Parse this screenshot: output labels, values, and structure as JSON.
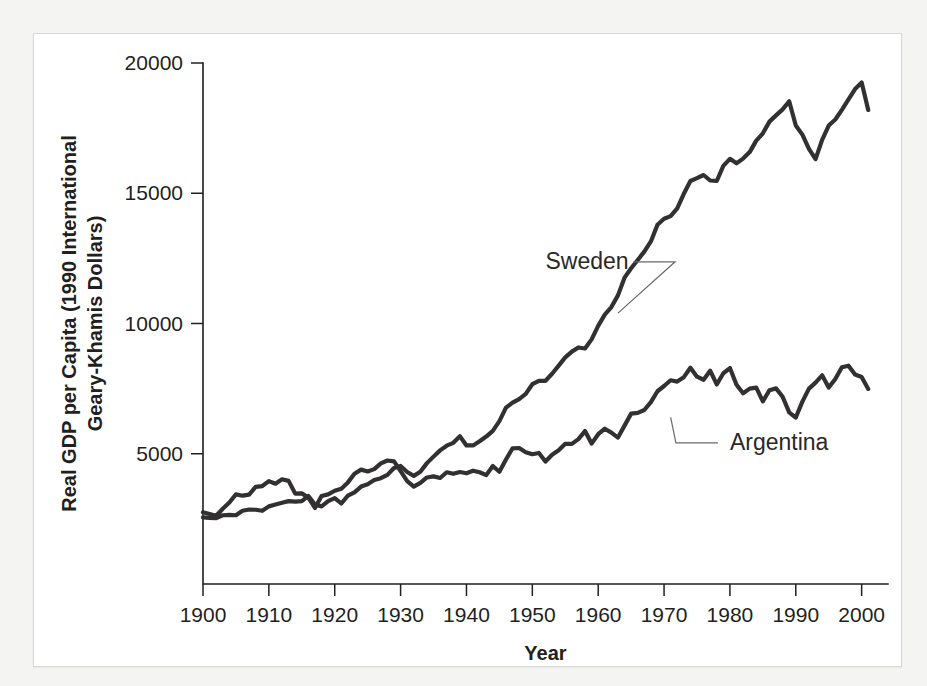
{
  "figure": {
    "background_color": "#f4f4f3",
    "card_color": "#ffffff",
    "line_color": "#333031",
    "text_color": "#231f20"
  },
  "chart_data": {
    "type": "line",
    "title": "",
    "xlabel": "Year",
    "ylabel": "Real GDP per Capita (1990 International Geary-Khamis Dollars)",
    "ylabel_line1": "Real GDP per Capita (1990 International",
    "ylabel_line2": "Geary-Khamis Dollars)",
    "xlim": [
      1900,
      2004
    ],
    "ylim": [
      0,
      20000
    ],
    "xticks": [
      1900,
      1910,
      1920,
      1930,
      1940,
      1950,
      1960,
      1970,
      1980,
      1990,
      2000
    ],
    "xtick_labels": [
      "1900",
      "1910",
      "1920",
      "1930",
      "1940",
      "1950",
      "1960",
      "1970",
      "1980",
      "1990",
      "2000"
    ],
    "yticks": [
      5000,
      10000,
      15000,
      20000
    ],
    "ytick_labels": [
      "5000",
      "10000",
      "15000",
      "20000"
    ],
    "grid": false,
    "legend": "annotations",
    "annotations": [
      {
        "text": "Sweden",
        "label_x": 1952,
        "label_y": 12100,
        "point_x": 1963,
        "point_y": 10400
      },
      {
        "text": "Argentina",
        "label_x": 1980,
        "label_y": 5150,
        "point_x": 1971,
        "point_y": 6400
      }
    ],
    "series": [
      {
        "name": "Sweden",
        "x": [
          1900,
          1901,
          1902,
          1903,
          1904,
          1905,
          1906,
          1907,
          1908,
          1909,
          1910,
          1911,
          1912,
          1913,
          1914,
          1915,
          1916,
          1917,
          1918,
          1919,
          1920,
          1921,
          1922,
          1923,
          1924,
          1925,
          1926,
          1927,
          1928,
          1929,
          1930,
          1931,
          1932,
          1933,
          1934,
          1935,
          1936,
          1937,
          1938,
          1939,
          1940,
          1941,
          1942,
          1943,
          1944,
          1945,
          1946,
          1947,
          1948,
          1949,
          1950,
          1951,
          1952,
          1953,
          1954,
          1955,
          1956,
          1957,
          1958,
          1959,
          1960,
          1961,
          1962,
          1963,
          1964,
          1965,
          1966,
          1967,
          1968,
          1969,
          1970,
          1971,
          1972,
          1973,
          1974,
          1975,
          1976,
          1977,
          1978,
          1979,
          1980,
          1981,
          1982,
          1983,
          1984,
          1985,
          1986,
          1987,
          1988,
          1989,
          1990,
          1991,
          1992,
          1993,
          1994,
          1995,
          1996,
          1997,
          1998,
          1999,
          2000,
          2001
        ],
        "values": [
          2561,
          2540,
          2530,
          2640,
          2650,
          2640,
          2810,
          2860,
          2850,
          2810,
          2980,
          3050,
          3120,
          3180,
          3160,
          3180,
          3380,
          3050,
          2980,
          3180,
          3300,
          3090,
          3390,
          3520,
          3740,
          3830,
          3990,
          4060,
          4190,
          4450,
          4530,
          4300,
          4150,
          4310,
          4640,
          4890,
          5130,
          5310,
          5420,
          5670,
          5320,
          5320,
          5480,
          5660,
          5880,
          6250,
          6770,
          6960,
          7100,
          7300,
          7670,
          7800,
          7800,
          8070,
          8380,
          8700,
          8920,
          9080,
          9040,
          9390,
          9910,
          10340,
          10630,
          11080,
          11760,
          12120,
          12440,
          12760,
          13150,
          13790,
          14020,
          14120,
          14420,
          14980,
          15470,
          15580,
          15700,
          15490,
          15470,
          16050,
          16320,
          16150,
          16330,
          16580,
          17020,
          17300,
          17750,
          17990,
          18220,
          18530,
          17600,
          17250,
          16700,
          16310,
          17050,
          17600,
          17830,
          18200,
          18600,
          19000,
          19250,
          18200
        ]
      },
      {
        "name": "Argentina",
        "x": [
          1900,
          1901,
          1902,
          1903,
          1904,
          1905,
          1906,
          1907,
          1908,
          1909,
          1910,
          1911,
          1912,
          1913,
          1914,
          1915,
          1916,
          1917,
          1918,
          1919,
          1920,
          1921,
          1922,
          1923,
          1924,
          1925,
          1926,
          1927,
          1928,
          1929,
          1930,
          1931,
          1932,
          1933,
          1934,
          1935,
          1936,
          1937,
          1938,
          1939,
          1940,
          1941,
          1942,
          1943,
          1944,
          1945,
          1946,
          1947,
          1948,
          1949,
          1950,
          1951,
          1952,
          1953,
          1954,
          1955,
          1956,
          1957,
          1958,
          1959,
          1960,
          1961,
          1962,
          1963,
          1964,
          1965,
          1966,
          1967,
          1968,
          1969,
          1970,
          1971,
          1972,
          1973,
          1974,
          1975,
          1976,
          1977,
          1978,
          1979,
          1980,
          1981,
          1982,
          1983,
          1984,
          1985,
          1986,
          1987,
          1988,
          1989,
          1990,
          1991,
          1992,
          1993,
          1994,
          1995,
          1996,
          1997,
          1998,
          1999,
          2000,
          2001
        ],
        "values": [
          2756,
          2690,
          2620,
          2890,
          3130,
          3440,
          3390,
          3430,
          3730,
          3760,
          3950,
          3850,
          4020,
          3960,
          3470,
          3480,
          3320,
          2920,
          3380,
          3440,
          3580,
          3660,
          3900,
          4230,
          4390,
          4320,
          4410,
          4630,
          4740,
          4710,
          4330,
          3950,
          3740,
          3880,
          4090,
          4130,
          4070,
          4290,
          4230,
          4300,
          4250,
          4350,
          4290,
          4180,
          4530,
          4310,
          4780,
          5210,
          5220,
          5060,
          4980,
          5030,
          4700,
          4960,
          5130,
          5380,
          5380,
          5560,
          5870,
          5390,
          5750,
          5960,
          5810,
          5620,
          6080,
          6540,
          6570,
          6680,
          6980,
          7400,
          7600,
          7820,
          7770,
          7940,
          8300,
          7960,
          7840,
          8190,
          7660,
          8090,
          8290,
          7650,
          7320,
          7500,
          7540,
          7010,
          7440,
          7510,
          7190,
          6590,
          6390,
          7000,
          7500,
          7730,
          8010,
          7540,
          7870,
          8320,
          8380,
          8040,
          7950,
          7490
        ]
      }
    ]
  }
}
